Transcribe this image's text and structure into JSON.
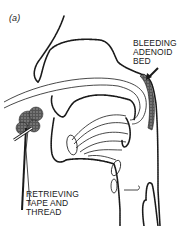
{
  "figure": {
    "panel_label": "(a)",
    "labels": {
      "bleeding": [
        "BLEEDING",
        "ADENOID",
        "BED"
      ],
      "retrieving": [
        "RETRIEVING",
        "TAPE AND",
        "THREAD"
      ]
    },
    "colors": {
      "ink": "#1a1a1a",
      "background": "#ffffff",
      "pack": "#444444"
    }
  }
}
